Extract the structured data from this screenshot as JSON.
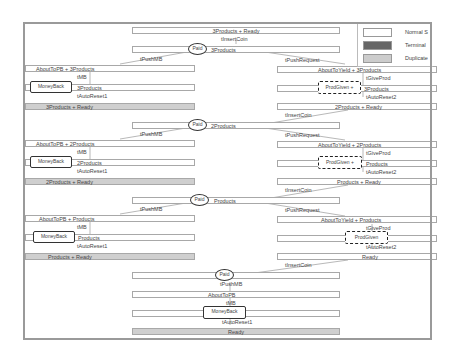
{
  "diagram": {
    "legend": [
      {
        "label": "Normal S",
        "color": "#ffffff"
      },
      {
        "label": "Terminal",
        "color": "#666666"
      },
      {
        "label": "Duplicate",
        "color": "#cccccc"
      }
    ],
    "blocks": [
      {
        "top_state": "3Products + Ready",
        "insert_coin": "tInsertCoin",
        "paid_label": "Paid",
        "paid_state": "3Products",
        "push_mb": "tPushMB",
        "push_request": "tPushRequest",
        "left": {
          "about": "AboutToPB + 3Products",
          "tmb": "tMB",
          "money_back": "MoneyBack",
          "state": "3Products",
          "reset": "tAutoReset1",
          "ready": "3Products + Ready"
        },
        "right": {
          "about": "AboutToYield + 3Products",
          "give": "tGiveProd",
          "prod_given": "ProdGiven +",
          "state": "3Products",
          "reset": "tAutoReset2",
          "ready": "2Products + Ready"
        }
      },
      {
        "insert_coin": "tInsertCoin",
        "paid_label": "Paid",
        "paid_state": "2Products",
        "push_mb": "tPushMB",
        "push_request": "tPushRequest",
        "left": {
          "about": "AboutToPB + 2Products",
          "tmb": "tMB",
          "money_back": "MoneyBack",
          "state": "2Products",
          "reset": "tAutoReset1",
          "ready": "2Products + Ready"
        },
        "right": {
          "about": "AboutToYield + 2Products",
          "give": "tGiveProd",
          "prod_given": "ProdGiven +",
          "state": "Products",
          "reset": "tAutoReset2",
          "ready": "Products + Ready"
        }
      },
      {
        "insert_coin": "tInsertCoin",
        "paid_label": "Paid",
        "paid_state": "Products",
        "push_mb": "tPushMB",
        "push_request": "tPushRequest",
        "left": {
          "about": "AboutToPB + Products",
          "tmb": "tMB",
          "money_back": "MoneyBack",
          "state": "Products",
          "reset": "tAutoReset1",
          "ready": "Products + Ready"
        },
        "right": {
          "about": "AboutToYield + Products",
          "give": "tGiveProd",
          "prod_given": "ProdGiven",
          "state": "",
          "reset": "tAutoReset2",
          "ready": "Ready"
        }
      }
    ],
    "final": {
      "insert_coin": "tInsertCoin",
      "paid_label": "Paid",
      "push_mb": "tPushMB",
      "about": "AboutToPB",
      "tmb": "tMB",
      "money_back": "MoneyBack",
      "reset": "tAutoReset1",
      "ready": "Ready"
    }
  }
}
